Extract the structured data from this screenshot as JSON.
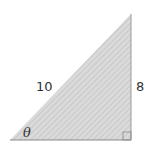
{
  "diagram": {
    "type": "right-triangle",
    "labels": {
      "hypotenuse": "10",
      "opposite": "8",
      "angle": "θ"
    },
    "colors": {
      "fill": "#d9d9d9",
      "hatch": "#c4c4c4",
      "stroke": "#8a8a8a",
      "text": "#333333"
    },
    "right_angle_marker": true
  }
}
